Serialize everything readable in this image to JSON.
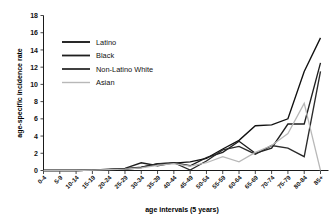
{
  "chart_data": {
    "type": "line",
    "title": "",
    "xlabel": "age intervals (5 years)",
    "ylabel": "age-specific incidence rate",
    "ylim": [
      0,
      18
    ],
    "ytick_step": 2,
    "yticks": [
      0,
      2,
      4,
      6,
      8,
      10,
      12,
      14,
      16,
      18
    ],
    "grid": false,
    "legend_position": "upper-left-inside",
    "categories": [
      "0-4",
      "5-9",
      "10-14",
      "15-19",
      "20-24",
      "25-29",
      "30-34",
      "35-39",
      "40-44",
      "45-49",
      "50-54",
      "55-59",
      "60-64",
      "65-69",
      "70-74",
      "75-79",
      "80-84",
      "85+"
    ],
    "series": [
      {
        "name": "Latino",
        "color": "#111111",
        "values": [
          0,
          0,
          0,
          0.05,
          0.1,
          0.15,
          0.35,
          0.8,
          0.85,
          1.0,
          1.4,
          2.5,
          3.5,
          5.2,
          5.3,
          6.0,
          11.5,
          15.4
        ]
      },
      {
        "name": "Black",
        "color": "#1f1f1f",
        "values": [
          0,
          0,
          0,
          0.05,
          0.15,
          0.25,
          0.9,
          0.55,
          0.9,
          0.55,
          1.5,
          2.1,
          3.4,
          2.0,
          2.6,
          5.4,
          5.4,
          12.5
        ]
      },
      {
        "name": "Non-Latino White",
        "color": "#2b2b2b",
        "values": [
          0,
          0,
          0,
          0.05,
          0.1,
          0.2,
          0.4,
          0.75,
          0.9,
          0.05,
          1.1,
          2.4,
          2.8,
          1.9,
          2.9,
          2.6,
          1.6,
          11.5
        ]
      },
      {
        "name": "Asian",
        "color": "#b8b8b8",
        "values": [
          0,
          0,
          0,
          0.05,
          0.1,
          0.15,
          0.3,
          0.6,
          0.8,
          0.5,
          0.9,
          1.6,
          1.0,
          2.1,
          2.9,
          4.3,
          7.8,
          0.0
        ]
      }
    ]
  },
  "legend": {
    "items": [
      {
        "label": "Latino"
      },
      {
        "label": "Black"
      },
      {
        "label": "Non-Latino White"
      },
      {
        "label": "Asian"
      }
    ]
  }
}
